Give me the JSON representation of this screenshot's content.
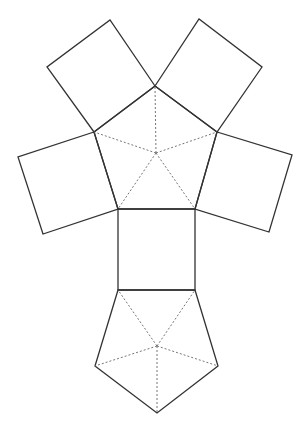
{
  "diagram": {
    "type": "net",
    "colors": {
      "background": "#ffffff",
      "solid_line": "#333333",
      "dashed_line": "#666666"
    },
    "top_pentagon": {
      "vertices": [
        [
          155,
          86
        ],
        [
          217,
          132
        ],
        [
          195,
          209
        ],
        [
          118,
          209
        ],
        [
          94,
          132
        ]
      ],
      "center": [
        156,
        153
      ]
    },
    "bottom_pentagon": {
      "vertices": [
        [
          118,
          290
        ],
        [
          195,
          290
        ],
        [
          218,
          366
        ],
        [
          157,
          413
        ],
        [
          95,
          366
        ]
      ],
      "center": [
        157,
        346
      ]
    },
    "squares": [
      {
        "name": "top-left-square",
        "points": [
          [
            94,
            132
          ],
          [
            155,
            86
          ],
          [
            110,
            20
          ],
          [
            47,
            67
          ]
        ]
      },
      {
        "name": "top-right-square",
        "points": [
          [
            155,
            86
          ],
          [
            217,
            132
          ],
          [
            262,
            67
          ],
          [
            199,
            19
          ]
        ]
      },
      {
        "name": "left-square",
        "points": [
          [
            94,
            132
          ],
          [
            118,
            209
          ],
          [
            43,
            234
          ],
          [
            18,
            157
          ]
        ]
      },
      {
        "name": "right-square",
        "points": [
          [
            217,
            132
          ],
          [
            195,
            209
          ],
          [
            269,
            232
          ],
          [
            292,
            155
          ]
        ]
      },
      {
        "name": "center-square",
        "points": [
          [
            118,
            209
          ],
          [
            195,
            209
          ],
          [
            195,
            290
          ],
          [
            118,
            290
          ]
        ]
      }
    ]
  }
}
